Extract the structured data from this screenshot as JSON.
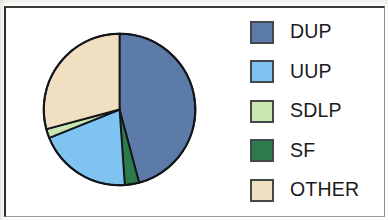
{
  "figure": {
    "background_color": "#ffffff",
    "frame_color": "#2b2b2b",
    "width": 388,
    "height": 220
  },
  "chart_data": {
    "type": "pie",
    "title": "",
    "subtitle": "",
    "xlabel": "",
    "ylabel": "",
    "grid": false,
    "legend_position": "right",
    "start_angle_deg": 0,
    "direction": "clockwise",
    "units": "percent",
    "categories": [
      "DUP",
      "UUP",
      "SDLP",
      "SF",
      "OTHER"
    ],
    "values": [
      46,
      20,
      2,
      3,
      29
    ],
    "colors": [
      "#5c7ba8",
      "#7fc4f0",
      "#c8e6b0",
      "#2d7a4a",
      "#f0dfc0"
    ],
    "slice_order_clockwise": [
      "DUP",
      "SF",
      "UUP",
      "SDLP",
      "OTHER"
    ],
    "slices": [
      {
        "label": "DUP",
        "value": 46,
        "color": "#5c7ba8",
        "start_deg": 0,
        "end_deg": 165
      },
      {
        "label": "SF",
        "value": 3,
        "color": "#2d7a4a",
        "start_deg": 165,
        "end_deg": 176
      },
      {
        "label": "UUP",
        "value": 20,
        "color": "#7fc4f0",
        "start_deg": 176,
        "end_deg": 248
      },
      {
        "label": "SDLP",
        "value": 2,
        "color": "#c8e6b0",
        "start_deg": 248,
        "end_deg": 255
      },
      {
        "label": "OTHER",
        "value": 29,
        "color": "#f0dfc0",
        "start_deg": 255,
        "end_deg": 360
      }
    ],
    "outline_color": "#13161c"
  },
  "legend": {
    "items": [
      {
        "label": "DUP",
        "color": "#5c7ba8",
        "swatch_name": "legend-swatch-dup"
      },
      {
        "label": "UUP",
        "color": "#7fc4f0",
        "swatch_name": "legend-swatch-uup"
      },
      {
        "label": "SDLP",
        "color": "#c8e6b0",
        "swatch_name": "legend-swatch-sdlp"
      },
      {
        "label": "SF",
        "color": "#2d7a4a",
        "swatch_name": "legend-swatch-sf"
      },
      {
        "label": "OTHER",
        "color": "#f0dfc0",
        "swatch_name": "legend-swatch-other"
      }
    ]
  }
}
